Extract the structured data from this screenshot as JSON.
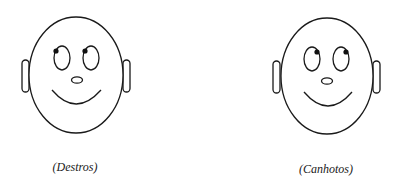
{
  "figure": {
    "faces": [
      {
        "id": "destros",
        "label": "(Destros)",
        "gaze": "up-left"
      },
      {
        "id": "canhotos",
        "label": "(Canhotos)",
        "gaze": "up-right"
      }
    ],
    "colors": {
      "line": "#1a1a1a",
      "pupil": "#111111",
      "background": "#ffffff"
    }
  }
}
